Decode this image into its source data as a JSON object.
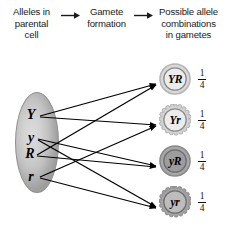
{
  "header": {
    "columns": [
      {
        "lines": [
          "Alleles in",
          "parental",
          "cell"
        ]
      },
      {
        "lines": [
          "Gamete",
          "formation"
        ]
      },
      {
        "lines": [
          "Possible allele",
          "combinations",
          "in gametes"
        ]
      }
    ],
    "arrow_1": "right-arrow-icon",
    "arrow_2": "right-arrow-icon"
  },
  "parent_cell": {
    "name": "parental-cell",
    "alleles": [
      {
        "symbol": "Y"
      },
      {
        "symbol": "y"
      },
      {
        "symbol": "R"
      },
      {
        "symbol": "r"
      }
    ]
  },
  "gametes": [
    {
      "label": "YR",
      "fraction_numerator": "1",
      "fraction_denominator": "4",
      "edge": "smooth",
      "fill": "#d9d9d9"
    },
    {
      "label": "Yr",
      "fraction_numerator": "1",
      "fraction_denominator": "4",
      "edge": "scalloped",
      "fill": "#dcdcdc"
    },
    {
      "label": "yR",
      "fraction_numerator": "1",
      "fraction_denominator": "4",
      "edge": "smooth",
      "fill": "#a8a8a8"
    },
    {
      "label": "yr",
      "fraction_numerator": "1",
      "fraction_denominator": "4",
      "edge": "scalloped",
      "fill": "#b0b0b0"
    }
  ],
  "connections": [
    {
      "from": "Y",
      "to": "YR"
    },
    {
      "from": "Y",
      "to": "Yr"
    },
    {
      "from": "y",
      "to": "yR"
    },
    {
      "from": "y",
      "to": "yr"
    },
    {
      "from": "R",
      "to": "YR"
    },
    {
      "from": "R",
      "to": "yR"
    },
    {
      "from": "r",
      "to": "Yr"
    },
    {
      "from": "r",
      "to": "yr"
    }
  ],
  "colors": {
    "ink": "#1a1a1a",
    "line": "#000000",
    "cell_fill": "#c6c6c6",
    "background": "#ffffff"
  }
}
